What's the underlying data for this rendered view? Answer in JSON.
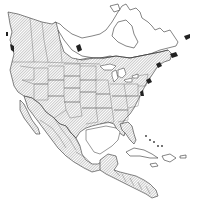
{
  "map": {
    "type": "range-map",
    "region": "North America",
    "style": "black-and-white outline with diagonal hatching",
    "legend": [],
    "labels": [],
    "shading": {
      "hatched_color": "#888888",
      "outline_color": "#333333",
      "background_color": "#ffffff"
    },
    "hatched_regions": [
      "Alaska (southern/central)",
      "Western Canada",
      "Southern Canada",
      "United States",
      "Mexico",
      "Central America"
    ],
    "unhatched_regions": [
      "Northern Canada / Nunavut",
      "Northern Quebec / Labrador",
      "Caribbean islands"
    ]
  }
}
